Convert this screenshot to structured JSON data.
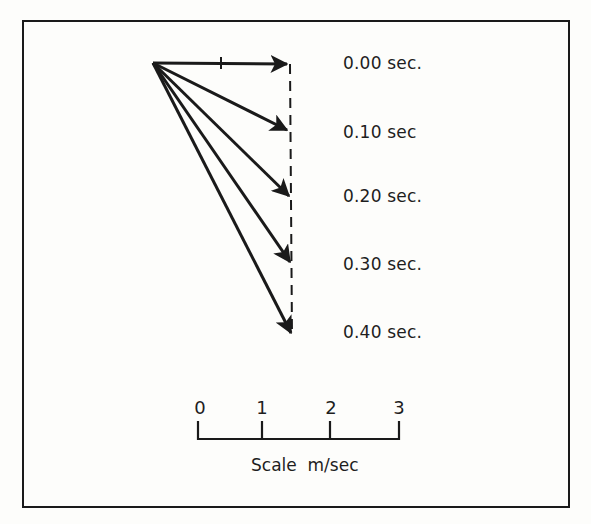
{
  "diagram": {
    "type": "vector diagram",
    "origin": [
      153,
      63
    ],
    "vectors": [
      {
        "time_label": "0.00 sec.",
        "tip": [
          289,
          64
        ]
      },
      {
        "time_label": "0.10 sec",
        "tip": [
          289,
          131
        ]
      },
      {
        "time_label": "0.20 sec.",
        "tip": [
          290,
          198
        ]
      },
      {
        "time_label": "0.30 sec.",
        "tip": [
          291,
          264
        ]
      },
      {
        "time_label": "0.40 sec.",
        "tip": [
          292,
          335
        ]
      }
    ],
    "horizontal_arrow_tick_x": 221,
    "dashed_line": {
      "x": 290,
      "from_y": 64,
      "to_y": 335
    }
  },
  "labels": {
    "t0": "0.00 sec.",
    "t1": "0.10 sec",
    "t2": "0.20 sec.",
    "t3": "0.30 sec.",
    "t4": "0.40 sec."
  },
  "scale": {
    "ticks": [
      "0",
      "1",
      "2",
      "3"
    ],
    "title": "Scale  m/sec",
    "unit": "m/sec"
  },
  "colors": {
    "ink": "#1a1a1a",
    "paper": "#fdfdfb"
  }
}
